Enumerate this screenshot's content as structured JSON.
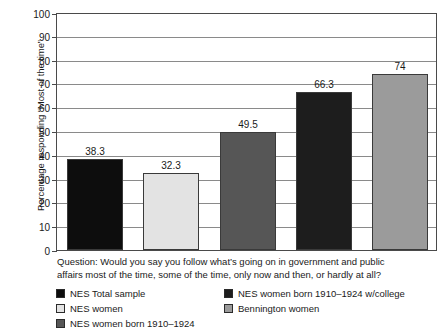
{
  "chart_data": {
    "type": "bar",
    "title": "",
    "xlabel": "",
    "ylabel": "Percentage responding “Most of the time”",
    "ylim": [
      0,
      100
    ],
    "ytick_interval": 10,
    "yticks": [
      "100",
      "90",
      "80",
      "70",
      "60",
      "50",
      "40",
      "30",
      "20",
      "10",
      "0"
    ],
    "grid": "horizontal",
    "legend_position": "below-plot",
    "categories": [
      "NES Total sample",
      "NES women",
      "NES women born 1910–1924",
      "NES women born 1910–1924 w/college",
      "Bennington women"
    ],
    "values": [
      38.3,
      32.3,
      49.5,
      66.3,
      74
    ],
    "value_labels": [
      "38.3",
      "32.3",
      "49.5",
      "66.3",
      "74"
    ],
    "colors": [
      "#0d0d0d",
      "#e3e3e3",
      "#565656",
      "#1d1d1d",
      "#9b9b9b"
    ],
    "annotation": "Question: Would you say you follow what’s going on in government and public affairs most of the time, some of the time, only now and then, or hardly at all?"
  },
  "caption": {
    "line1": "Question: Would you say you follow what’s going on in government and public",
    "line2": "affairs most of the time, some of the time, only now and then, or hardly at all?"
  },
  "legend": {
    "left_column": [
      {
        "label": "NES Total sample",
        "color": "#0d0d0d"
      },
      {
        "label": "NES women",
        "color": "#e3e3e3"
      },
      {
        "label": "NES women born 1910–1924",
        "color": "#565656"
      }
    ],
    "right_column": [
      {
        "label": "NES women born 1910–1924 w/college",
        "color": "#1d1d1d"
      },
      {
        "label": "Bennington women",
        "color": "#9b9b9b"
      }
    ]
  }
}
